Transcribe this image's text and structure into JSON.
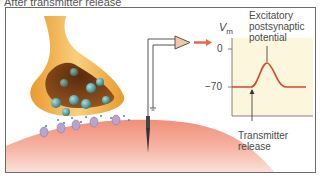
{
  "title": "After transmitter release",
  "diagram": {
    "components": {
      "presynaptic_terminal": "presynaptic-terminal",
      "vesicles": "synaptic-vesicles",
      "receptors": "postsynaptic-receptors",
      "postsynaptic_cell": "postsynaptic-membrane",
      "electrode": "recording-electrode",
      "amplifier": "amplifier",
      "ground": "ground-symbol",
      "output_arrow": "signal-arrow"
    },
    "graph": {
      "y_axis_label": "V",
      "y_axis_sub": "m",
      "tick_top": "0",
      "tick_bottom": "−70",
      "annotation_top_line1": "Excitatory",
      "annotation_top_line2": "postsynaptic",
      "annotation_top_line3": "potential",
      "annotation_bottom_line1": "Transmitter",
      "annotation_bottom_line2": "release"
    },
    "colors": {
      "terminal_outer": "#f2b34a",
      "terminal_inner": "#7a3b12",
      "vesicle": "#3c8f93",
      "receptor": "#b9a3cf",
      "postsynaptic": "#e9836a",
      "trace": "#d8452a",
      "graph_bg": "#fbf6dc",
      "frame": "#6b6b6b"
    }
  }
}
